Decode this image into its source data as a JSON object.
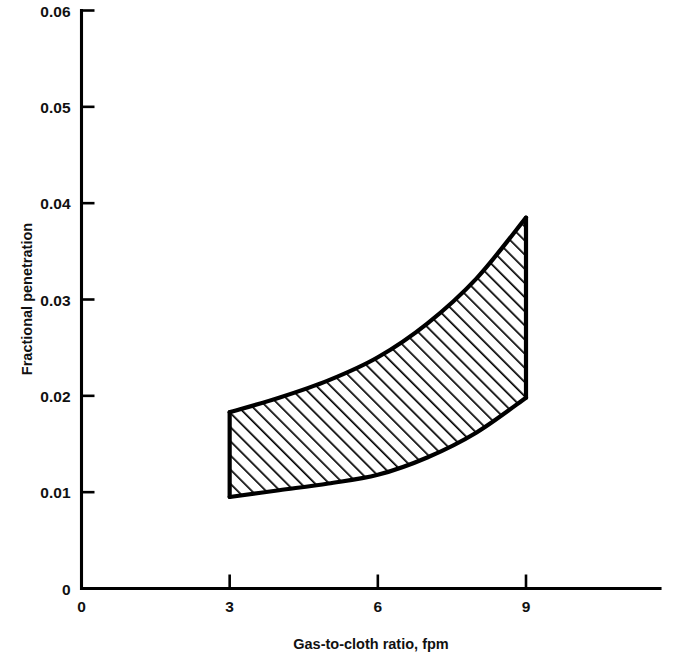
{
  "figure": {
    "background_color": "#ffffff",
    "ink_color": "#000000"
  },
  "axes": {
    "x": {
      "label": "Gas-to-cloth ratio, fpm",
      "tick_labels": [
        "0",
        "3",
        "6",
        "9"
      ],
      "tick_values": [
        0,
        3,
        6,
        9
      ],
      "range": [
        0,
        12
      ],
      "axis_end_value": 11.8
    },
    "y": {
      "label": "Fractional penetration",
      "tick_labels": [
        "0",
        "0.01",
        "0.02",
        "0.03",
        "0.04",
        "0.05",
        "0.06"
      ],
      "tick_values": [
        0,
        0.01,
        0.02,
        0.03,
        0.04,
        0.05,
        0.06
      ],
      "range": [
        0,
        0.06
      ]
    }
  },
  "chart_data": {
    "type": "area",
    "title": "",
    "subtitle": "",
    "xlabel": "Gas-to-cloth ratio, fpm",
    "ylabel": "Fractional penetration",
    "xlim": [
      0,
      12
    ],
    "ylim": [
      0,
      0.06
    ],
    "xticks": [
      0,
      3,
      6,
      9
    ],
    "yticks": [
      0,
      0.01,
      0.02,
      0.03,
      0.04,
      0.05,
      0.06
    ],
    "grid": false,
    "legend": null,
    "fill_style": "diagonal-hatch-45",
    "x": [
      3,
      4,
      5,
      6,
      7,
      8,
      9
    ],
    "series": [
      {
        "name": "Upper bound of fractional penetration band",
        "values": [
          0.0183,
          0.0198,
          0.0216,
          0.024,
          0.0275,
          0.0322,
          0.0385
        ]
      },
      {
        "name": "Lower bound of fractional penetration band",
        "values": [
          0.0095,
          0.0102,
          0.0109,
          0.0118,
          0.0136,
          0.0162,
          0.0198
        ]
      }
    ],
    "annotations": []
  }
}
